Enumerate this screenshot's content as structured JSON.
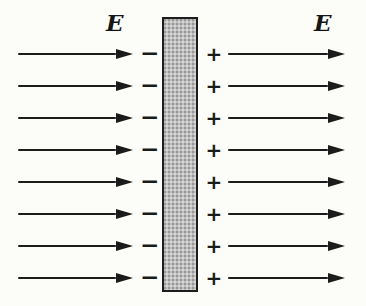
{
  "diagram": {
    "left_field_label": "E",
    "right_field_label": "E",
    "minus_sign": "−",
    "plus_sign": "+",
    "row_count": 8,
    "colors": {
      "ink": "#1b1b1b",
      "slab_fill": "#bdbdbd",
      "slab_border": "#1c1c1c",
      "background": "#fcfcf9"
    }
  }
}
